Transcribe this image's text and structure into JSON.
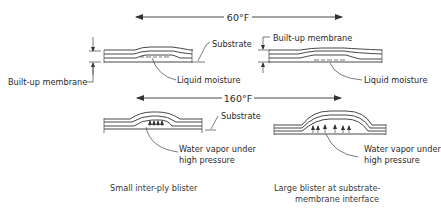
{
  "temperatures": {
    "top": "60°F",
    "bottom": "160°F"
  },
  "labels": {
    "substrate_top": "Substrate",
    "builtup_left": "Built-up membrane",
    "liquid_left": "Liquid moisture",
    "builtup_right": "Built-up membrane",
    "liquid_right": "Liquid moisture",
    "substrate_bottom": "Substrate",
    "vapor_left_1": "Water vapor under",
    "vapor_left_2": "high pressure",
    "vapor_right_1": "Water vapor under",
    "vapor_right_2": "high pressure"
  },
  "captions": {
    "left": "Small inter-ply blister",
    "right_1": "Large blister at substrate-",
    "right_2": "membrane interface"
  }
}
